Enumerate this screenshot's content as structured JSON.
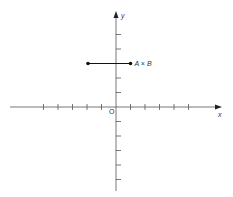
{
  "diagram": {
    "type": "coordinate-plane",
    "axes": {
      "x_label": "x",
      "y_label": "y",
      "origin_label": "O",
      "color": "#555555"
    },
    "x_ticks": [
      -5,
      -4,
      -3,
      -2,
      -1,
      1,
      2,
      3,
      4,
      5
    ],
    "y_ticks": [
      -5,
      -4,
      -3,
      -2,
      -1,
      1,
      2,
      3,
      4,
      5
    ],
    "segment": {
      "label": "A × B",
      "from": [
        -2,
        3
      ],
      "to": [
        1,
        3
      ],
      "color": "#111111"
    }
  }
}
